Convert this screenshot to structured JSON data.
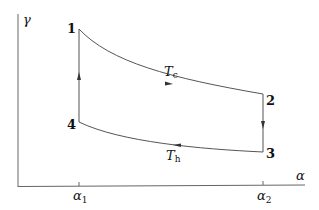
{
  "diagram": {
    "type": "thermodynamic-cycle",
    "axes": {
      "x_label": "α",
      "y_label": "γ",
      "x_ticks": [
        {
          "label": "α",
          "sub": "1"
        },
        {
          "label": "α",
          "sub": "2"
        }
      ]
    },
    "points": [
      {
        "id": "1",
        "label": "1"
      },
      {
        "id": "2",
        "label": "2"
      },
      {
        "id": "3",
        "label": "3"
      },
      {
        "id": "4",
        "label": "4"
      }
    ],
    "curves": {
      "upper": {
        "label": "T",
        "sub": "c",
        "from": "1",
        "to": "2"
      },
      "lower": {
        "label": "T",
        "sub": "h",
        "from": "3",
        "to": "4"
      },
      "right": {
        "from": "2",
        "to": "3"
      },
      "left": {
        "from": "4",
        "to": "1"
      }
    },
    "colors": {
      "line": "#555555",
      "text": "#111111",
      "background": "#ffffff"
    }
  }
}
